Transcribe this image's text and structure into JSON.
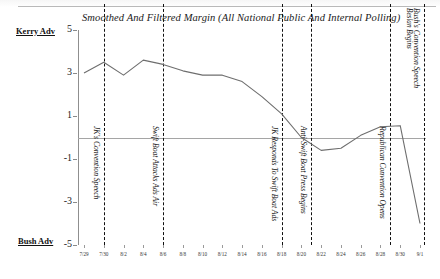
{
  "chart_data": {
    "type": "line",
    "title": "Smoothed And Filtered Margin (All National Public And Internal Polling)",
    "xlabel": "",
    "ylabel": "",
    "ylim": [
      -5,
      5
    ],
    "yticks": [
      5,
      3,
      1,
      -1,
      -3,
      -5
    ],
    "grid": false,
    "legend": "none",
    "axis_top_label": "Kerry Adv",
    "axis_bottom_label": "Bush Adv",
    "categories": [
      "7/29",
      "7/30",
      "8/2",
      "8/4",
      "8/6",
      "8/8",
      "8/10",
      "8/12",
      "8/14",
      "8/16",
      "8/18",
      "8/20",
      "8/22",
      "8/24",
      "8/26",
      "8/28",
      "8/30",
      "9/1"
    ],
    "x": [
      0,
      1,
      2,
      3,
      4,
      5,
      6,
      7,
      8,
      9,
      10,
      11,
      12,
      13,
      14,
      15,
      16,
      17
    ],
    "values": [
      3.0,
      3.5,
      2.9,
      3.6,
      3.4,
      3.1,
      2.9,
      2.9,
      2.6,
      1.9,
      1.1,
      0.0,
      -0.6,
      -0.5,
      0.1,
      0.5,
      0.55,
      -4.0
    ],
    "series": [
      {
        "name": "Smoothed And Filtered Margin",
        "values": [
          3.0,
          3.5,
          2.9,
          3.6,
          3.4,
          3.1,
          2.9,
          2.9,
          2.6,
          1.9,
          1.1,
          0.0,
          -0.6,
          -0.5,
          0.1,
          0.5,
          0.55,
          -4.0
        ]
      }
    ],
    "annotations": [
      {
        "label": "JK's Convention Speech",
        "x_category": "7/30",
        "x_index": 1
      },
      {
        "label": "Swift Boat Attacks Ads Air",
        "x_category": "8/6",
        "x_index": 4
      },
      {
        "label": "JK Responds To Swift Boat Ads",
        "x_category": "8/18",
        "x_index": 10
      },
      {
        "label": "Anti-Swift Boat Press Begins",
        "x_category": "8/21",
        "x_index": 11.5
      },
      {
        "label": "Republican Convention Opens",
        "x_category": "8/29",
        "x_index": 15.5
      },
      {
        "label": "Bush's Convention Speech",
        "x_category": "9/1",
        "x_index": 17.2
      },
      {
        "label": "Beslan Begins",
        "x_category": "9/1",
        "x_index": 17.2
      }
    ],
    "line_color": "#6e6e6e",
    "event_marker_color": "#111111"
  }
}
